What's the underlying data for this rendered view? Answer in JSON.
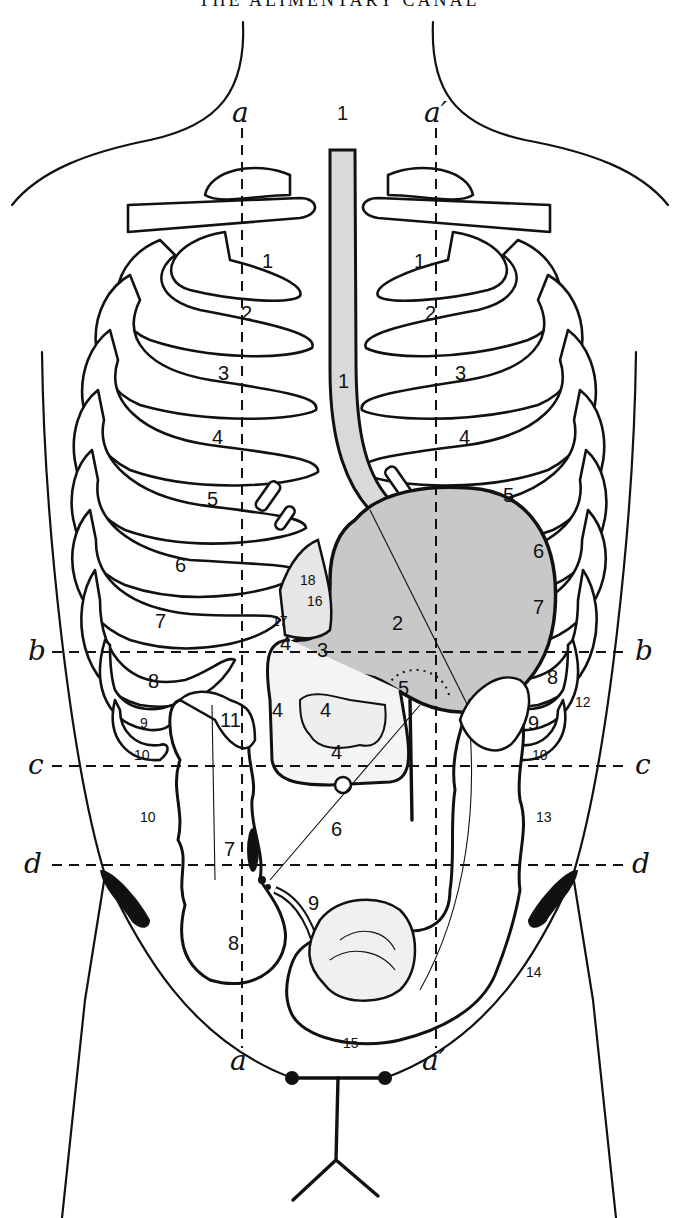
{
  "header": {
    "title": "THE ALIMENTARY CANAL"
  },
  "reference_lines": {
    "vertical": [
      {
        "id": "a",
        "label_top": "a",
        "label_bottom": "a"
      },
      {
        "id": "a_prime",
        "label_top": "a′",
        "label_bottom": "a′"
      }
    ],
    "horizontal": [
      {
        "id": "b",
        "label_left": "b",
        "label_right": "b"
      },
      {
        "id": "c",
        "label_left": "c",
        "label_right": "c"
      },
      {
        "id": "d",
        "label_left": "d",
        "label_right": "d"
      }
    ]
  },
  "ribs": {
    "left": [
      "1",
      "2",
      "3",
      "4",
      "5",
      "6",
      "7",
      "8",
      "9",
      "10"
    ],
    "right": [
      "1",
      "2",
      "3",
      "4",
      "5",
      "6",
      "7",
      "8",
      "9",
      "10"
    ]
  },
  "organ_labels": {
    "esophagus_top": "1",
    "esophagus_mid": "1",
    "stomach": "2",
    "pylorus": "3",
    "duodenum_upper": "4",
    "duodenum_left": "4",
    "duodenum_inner": "4",
    "duodenum_lower": "4",
    "pancreas_head": "5",
    "jejunum_line": "6",
    "ileocecal": "7",
    "cecum": "8",
    "appendix": "9",
    "ascending_colon": "10",
    "hepatic_flexure": "11",
    "splenic_flexure": "12",
    "descending_colon": "13",
    "sigmoid": "14",
    "rectum_loop": "15",
    "liver_area": "16",
    "arrow_17": "17",
    "label_18": "18"
  }
}
